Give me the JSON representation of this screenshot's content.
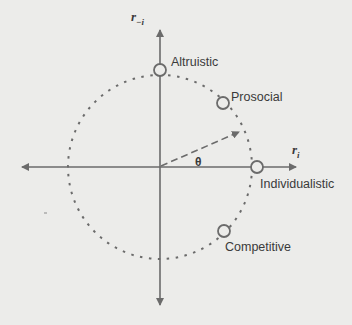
{
  "diagram": {
    "type": "circular social value orientation diagram",
    "axes": {
      "x_label": "r",
      "x_label_sub": "i",
      "y_label": "r",
      "y_label_sub": "−i"
    },
    "angle_label": "θ",
    "points": [
      {
        "name": "Altruistic",
        "angle_deg": 90
      },
      {
        "name": "Prosocial",
        "angle_deg": 45
      },
      {
        "name": "Individualistic",
        "angle_deg": 0
      },
      {
        "name": "Competitive",
        "angle_deg": -45
      }
    ],
    "colors": {
      "line": "#6b6b6b",
      "text": "#3a3a3a",
      "background": "#ececea"
    }
  }
}
